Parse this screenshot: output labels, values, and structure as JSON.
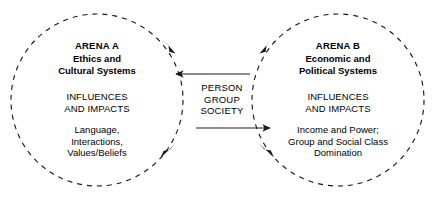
{
  "figure": {
    "type": "two-arena-cyclical-influence-diagram",
    "background_color": "#ffffff",
    "stroke_color": "#1a1a1a"
  },
  "arena_a": {
    "title": "ARENA A",
    "subtitle_line1": "Ethics and",
    "subtitle_line2": "Cultural Systems",
    "influences_line1": "INFLUENCES",
    "influences_line2": "AND IMPACTS",
    "details": [
      "Language,",
      "Interactions,",
      "Values/Beliefs"
    ]
  },
  "arena_b": {
    "title": "ARENA B",
    "subtitle_line1": "Economic and",
    "subtitle_line2": "Political Systems",
    "influences_line1": "INFLUENCES",
    "influences_line2": "AND IMPACTS",
    "details": [
      "Income and Power;",
      "Group and Social Class",
      "Domination"
    ]
  },
  "center": {
    "line1": "PERSON",
    "line2": "GROUP",
    "line3": "SOCIETY"
  },
  "connectors": {
    "top_arrow_direction": "left",
    "bottom_arrow_direction": "right"
  }
}
